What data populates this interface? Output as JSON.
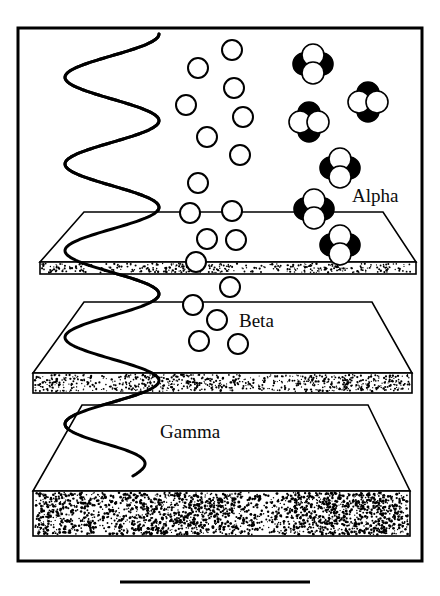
{
  "figure": {
    "title_visible": false,
    "caption_rule": true,
    "background_color": "#ffffff",
    "ink_color": "#000000",
    "frame": {
      "x": 18,
      "y": 28,
      "width": 404,
      "height": 533,
      "stroke_width": 3
    },
    "bottom_rule": {
      "x1": 120,
      "x2": 310,
      "y": 582,
      "stroke_width": 3
    }
  },
  "labels": [
    {
      "name": "alpha-label",
      "text": "Alpha",
      "x": 352,
      "y": 202
    },
    {
      "name": "beta-label",
      "text": "Beta",
      "x": 239,
      "y": 327
    },
    {
      "name": "gamma-label",
      "text": "Gamma",
      "x": 160,
      "y": 438
    }
  ],
  "plates": [
    {
      "name": "plate-paper",
      "label": "Alpha",
      "back_left_x": 84,
      "back_right_x": 383,
      "back_y": 212,
      "front_left_x": 40,
      "front_right_x": 416,
      "front_y": 262,
      "edge_thickness": 12,
      "speckle_density": "light"
    },
    {
      "name": "plate-aluminium",
      "label": "Beta",
      "back_left_x": 84,
      "back_right_x": 372,
      "back_y": 302,
      "front_left_x": 33,
      "front_right_x": 412,
      "front_y": 373,
      "edge_thickness": 20,
      "speckle_density": "medium"
    },
    {
      "name": "plate-lead",
      "label": "Gamma",
      "back_left_x": 82,
      "back_right_x": 368,
      "back_y": 405,
      "front_left_x": 33,
      "front_right_x": 410,
      "front_y": 491,
      "edge_thickness": 45,
      "speckle_density": "heavy"
    }
  ],
  "gamma_wave": {
    "name": "gamma-wave",
    "description": "vertical sinusoidal ray passing through all three plates",
    "amplitude": 47,
    "x_center": 112,
    "y_start": 34,
    "y_end": 476,
    "stroke_width": 3
  },
  "beta_particles": {
    "name": "beta-particles",
    "radius": 10,
    "stroke_width": 2,
    "fill": "#ffffff",
    "positions": [
      [
        232,
        50
      ],
      [
        198,
        68
      ],
      [
        186,
        105
      ],
      [
        234,
        88
      ],
      [
        243,
        117
      ],
      [
        207,
        137
      ],
      [
        240,
        155
      ],
      [
        198,
        183
      ],
      [
        190,
        213
      ],
      [
        232,
        211
      ],
      [
        207,
        239
      ],
      [
        236,
        240
      ],
      [
        196,
        262
      ],
      [
        230,
        287
      ],
      [
        193,
        305
      ],
      [
        217,
        320
      ],
      [
        199,
        341
      ],
      [
        238,
        344
      ]
    ]
  },
  "alpha_particles": {
    "name": "alpha-particles",
    "circle_radius": 11,
    "offset": 9,
    "description": "clusters of four overlapping nucleons, two black (protons) and two white (neutrons)",
    "colors": {
      "proton": "#000000",
      "neutron": "#ffffff"
    },
    "clusters": [
      {
        "cx": 313,
        "cy": 64,
        "pattern": [
          "white",
          "black",
          "black",
          "white"
        ]
      },
      {
        "cx": 368,
        "cy": 102,
        "pattern": [
          "black",
          "white",
          "white",
          "black"
        ]
      },
      {
        "cx": 309,
        "cy": 122,
        "pattern": [
          "black",
          "white",
          "white",
          "black"
        ]
      },
      {
        "cx": 340,
        "cy": 168,
        "pattern": [
          "white",
          "black",
          "black",
          "white"
        ]
      },
      {
        "cx": 314,
        "cy": 209,
        "pattern": [
          "white",
          "black",
          "black",
          "white"
        ]
      },
      {
        "cx": 340,
        "cy": 245,
        "pattern": [
          "white",
          "black",
          "black",
          "white"
        ]
      }
    ]
  },
  "speckles": {
    "paper_count": 260,
    "aluminium_count": 520,
    "lead_count": 1500
  }
}
